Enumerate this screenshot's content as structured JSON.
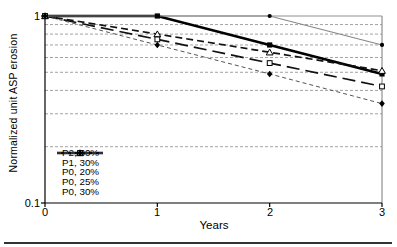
{
  "chart_data": {
    "type": "line",
    "title": "",
    "xlabel": "Years",
    "ylabel": "Normalized unit ASP erosion",
    "x": [
      0,
      1,
      2,
      3
    ],
    "x_tick_labels": [
      "0",
      "1",
      "2",
      "3"
    ],
    "y_scale": "log",
    "ylim": [
      0.1,
      1
    ],
    "y_tick_labels": [
      "1",
      "0.1"
    ],
    "gridlines_y": [
      0.9,
      0.8,
      0.7,
      0.6,
      0.5,
      0.4,
      0.3,
      0.2
    ],
    "grid_on": true,
    "grid_color": "#999999",
    "axis_color": "#000000",
    "frame_color": "#8f8f8f",
    "legend_position": "inside-lower-left",
    "series": [
      {
        "name": "P2, 30%",
        "values": [
          1,
          1,
          1,
          0.7
        ],
        "color": "#878787",
        "line": "solid",
        "width": 1.2,
        "dash": "",
        "marker": "filled-circle",
        "marker_color": "#000000"
      },
      {
        "name": "P1, 30%",
        "values": [
          1,
          1,
          0.7,
          0.49
        ],
        "color": "#000000",
        "line": "solid",
        "width": 2.6,
        "dash": "",
        "marker": "filled-square",
        "marker_color": "#000000"
      },
      {
        "name": "P0, 20%",
        "values": [
          1,
          0.8,
          0.64,
          0.51
        ],
        "color": "#111111",
        "line": "dashed",
        "width": 1.7,
        "dash": "7,4",
        "marker": "open-triangle",
        "marker_color": "#000000"
      },
      {
        "name": "P0, 25%",
        "values": [
          1,
          0.75,
          0.56,
          0.42
        ],
        "color": "#111111",
        "line": "long-dash",
        "width": 1.7,
        "dash": "13,6",
        "marker": "open-square",
        "marker_color": "#000000"
      },
      {
        "name": "P0, 30%",
        "values": [
          1,
          0.7,
          0.49,
          0.34
        ],
        "color": "#555555",
        "line": "fine-dash",
        "width": 1.0,
        "dash": "4,3",
        "marker": "filled-diamond",
        "marker_color": "#000000"
      }
    ]
  }
}
